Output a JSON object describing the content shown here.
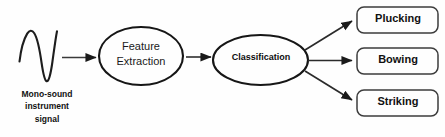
{
  "diagram": {
    "background_color": "#fefefe",
    "stroke_color": "#1a1a1a",
    "text_color": "#111111",
    "source": {
      "icon": "waveform-icon",
      "caption_lines": [
        "Mono-sound",
        "instrument",
        "signal"
      ],
      "caption_full": "Mono-sound instrument signal"
    },
    "stages": [
      {
        "id": "feature-extraction",
        "shape": "ellipse",
        "label_lines": [
          "Feature",
          "Extraction"
        ],
        "label_full": "Feature Extraction"
      },
      {
        "id": "classification",
        "shape": "ellipse",
        "label_lines": [
          "Classification"
        ],
        "label_full": "Classification"
      }
    ],
    "outputs": [
      {
        "id": "plucking",
        "shape": "rounded-rect",
        "label": "Plucking"
      },
      {
        "id": "bowing",
        "shape": "rounded-rect",
        "label": "Bowing"
      },
      {
        "id": "striking",
        "shape": "rounded-rect",
        "label": "Striking"
      }
    ],
    "connectors": [
      {
        "from": "waveform",
        "to": "feature-extraction",
        "type": "arrow"
      },
      {
        "from": "feature-extraction",
        "to": "classification",
        "type": "arrow"
      },
      {
        "from": "classification",
        "to": "plucking",
        "type": "arrow"
      },
      {
        "from": "classification",
        "to": "bowing",
        "type": "arrow"
      },
      {
        "from": "classification",
        "to": "striking",
        "type": "arrow"
      }
    ]
  }
}
